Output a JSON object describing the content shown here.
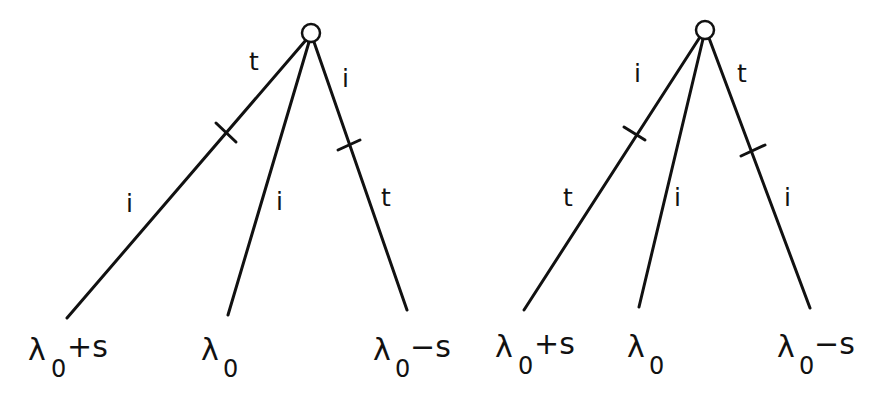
{
  "diagram": {
    "trees": [
      {
        "root": {
          "x": 311,
          "y": 33,
          "r": 9
        },
        "branches": [
          {
            "end": {
              "x": 67,
              "y": 318
            },
            "tick": {
              "x": 227,
              "y": 133
            },
            "upper_label": "t",
            "lower_label": "i",
            "bottom_label": {
              "base": "λ",
              "sub": "0",
              "sup": "+s"
            }
          },
          {
            "end": {
              "x": 228,
              "y": 315
            },
            "tick": null,
            "upper_label": "",
            "lower_label": "i",
            "bottom_label": {
              "base": "λ",
              "sub": "0",
              "sup": ""
            }
          },
          {
            "end": {
              "x": 407,
              "y": 310
            },
            "tick": {
              "x": 348,
              "y": 145
            },
            "upper_label": "i",
            "lower_label": "t",
            "bottom_label": {
              "base": "λ",
              "sub": "0",
              "sup": "−s"
            }
          }
        ]
      },
      {
        "root": {
          "x": 705,
          "y": 30,
          "r": 9
        },
        "branches": [
          {
            "end": {
              "x": 524,
              "y": 310
            },
            "tick": {
              "x": 636,
              "y": 134
            },
            "upper_label": "i",
            "lower_label": "t",
            "bottom_label": {
              "base": "λ",
              "sub": "0",
              "sup": "+s"
            }
          },
          {
            "end": {
              "x": 639,
              "y": 307
            },
            "tick": null,
            "upper_label": "",
            "lower_label": "i",
            "bottom_label": {
              "base": "λ",
              "sub": "0",
              "sup": ""
            }
          },
          {
            "end": {
              "x": 810,
              "y": 308
            },
            "tick": {
              "x": 752,
              "y": 150
            },
            "upper_label": "t",
            "lower_label": "i",
            "bottom_label": {
              "base": "λ",
              "sub": "0",
              "sup": "−s"
            }
          }
        ]
      }
    ],
    "labels": {
      "left": {
        "t_upper_left": "t",
        "i_upper_right": "i",
        "i_lower_left": "i",
        "i_lower_mid": "i",
        "t_lower_right": "t",
        "bottom_left": {
          "base": "λ",
          "sub": "0",
          "sup": "+s"
        },
        "bottom_mid": {
          "base": "λ",
          "sub": "0"
        },
        "bottom_right": {
          "base": "λ",
          "sub": "0",
          "sup": "−s"
        }
      },
      "right": {
        "i_upper_left": "i",
        "t_upper_right": "t",
        "t_lower_left": "t",
        "i_lower_mid": "i",
        "i_lower_right": "i",
        "bottom_left": {
          "base": "λ",
          "sub": "0",
          "sup": "+s"
        },
        "bottom_mid": {
          "base": "λ",
          "sub": "0"
        },
        "bottom_right": {
          "base": "λ",
          "sub": "0",
          "sup": "−s"
        }
      }
    },
    "colors": {
      "ink": "#111111",
      "background": "#ffffff"
    }
  }
}
